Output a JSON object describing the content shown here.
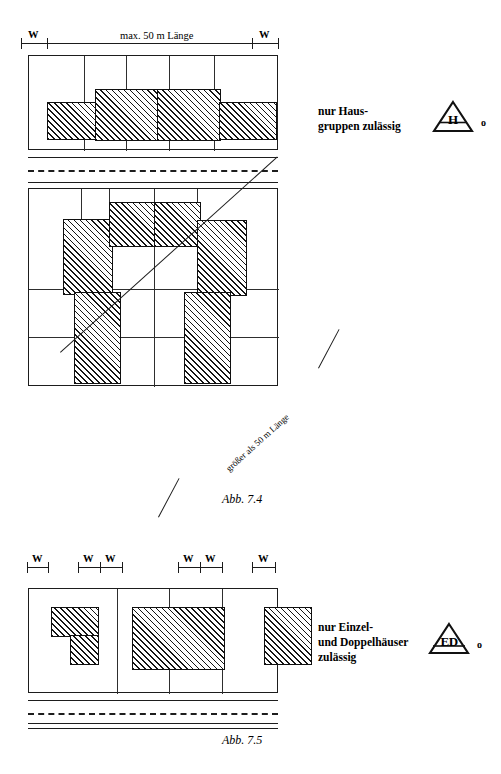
{
  "figure_7_4": {
    "top_dimension": {
      "left_mark": "W",
      "right_mark": "W",
      "span_label": "max.  50 m  Länge"
    },
    "diagonal_label": "größer als 50 m Länge",
    "legend": {
      "line1": "nur Haus-",
      "line2": "gruppen zulässig",
      "symbol_letters": "H",
      "symbol_suffix": "o"
    },
    "caption": "Abb. 7.4",
    "block1": {
      "plots": 5,
      "buildings": [
        {
          "x": 18,
          "y": 46,
          "w": 60,
          "h": 38
        },
        {
          "x": 66,
          "y": 33,
          "w": 65,
          "h": 52
        },
        {
          "x": 128,
          "y": 33,
          "w": 64,
          "h": 52
        },
        {
          "x": 190,
          "y": 46,
          "w": 58,
          "h": 38
        }
      ]
    },
    "block2": {
      "buildings": [
        {
          "x": 34,
          "y": 30,
          "w": 50,
          "h": 76
        },
        {
          "x": 80,
          "y": 13,
          "w": 48,
          "h": 45
        },
        {
          "x": 125,
          "y": 13,
          "w": 47,
          "h": 45
        },
        {
          "x": 168,
          "y": 31,
          "w": 50,
          "h": 76
        },
        {
          "x": 45,
          "y": 103,
          "w": 47,
          "h": 92
        },
        {
          "x": 155,
          "y": 103,
          "w": 47,
          "h": 92
        }
      ]
    }
  },
  "figure_7_5": {
    "dimension_marks": [
      "W",
      "W",
      "W",
      "W",
      "W",
      "W"
    ],
    "legend": {
      "line1": "nur Einzel-",
      "line2": "und Doppelhäuser",
      "line3": "zulässig",
      "symbol_letters": "ED",
      "symbol_suffix": "o"
    },
    "caption": "Abb. 7.5",
    "block": {
      "plots": 4,
      "buildings": [
        {
          "type": "L",
          "x": 22,
          "y": 18,
          "w": 48,
          "h": 58
        },
        {
          "type": "rect",
          "x": 103,
          "y": 18,
          "w": 93,
          "h": 63
        },
        {
          "type": "rect",
          "x": 235,
          "y": 18,
          "w": 48,
          "h": 58
        }
      ]
    }
  },
  "colors": {
    "ink": "#1a1a1a",
    "hatch": "#151515",
    "paper": "#ffffff"
  }
}
